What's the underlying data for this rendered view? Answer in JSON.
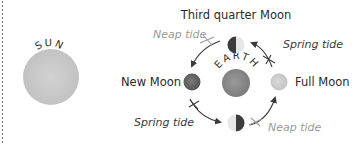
{
  "sun": {
    "label": "SUN",
    "color": "#c9c9c9"
  },
  "earth": {
    "label": "EARTH",
    "color": "#8f8f8f"
  },
  "moons": {
    "third_quarter": {
      "label": "Third quarter Moon"
    },
    "new": {
      "label": "New Moon",
      "color": "#6e6e6e"
    },
    "full": {
      "label": "Full Moon",
      "color": "#cfcfcf"
    },
    "first_quarter": {
      "label": ""
    }
  },
  "tides": {
    "top_left": {
      "label": "Neap tide",
      "color": "#9a9a9a"
    },
    "top_right": {
      "label": "Spring tide",
      "color": "#3a3a3a"
    },
    "bottom_left": {
      "label": "Spring tide",
      "color": "#3a3a3a"
    },
    "bottom_right": {
      "label": "Neap tide",
      "color": "#9a9a9a"
    }
  },
  "colors": {
    "dark_half": "#3c3c3c",
    "light_half": "#e6e6e6",
    "arrow": "#3a3a3a",
    "neap_mark": "#9a9a9a"
  }
}
